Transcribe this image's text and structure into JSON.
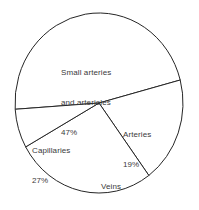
{
  "chart_data": {
    "type": "pie",
    "title": "",
    "subtitle": "",
    "xlabel": "",
    "ylabel": "",
    "legend_position": "none",
    "grid": false,
    "units": "percent",
    "total": 100,
    "categories": [
      "Small arteries and arterioles",
      "Arteries",
      "Capillaries",
      "Veins"
    ],
    "values": [
      47,
      19,
      27,
      7
    ],
    "slices": [
      {
        "label_line1": "Small arteries",
        "label_line2": "and arterioles",
        "value_text": "47%",
        "value": 47,
        "color": "#ffffff",
        "stroke": "#262626"
      },
      {
        "label_line1": "Arteries",
        "label_line2": "",
        "value_text": "19%",
        "value": 19,
        "color": "#ffffff",
        "stroke": "#262626"
      },
      {
        "label_line1": "Capillaries",
        "label_line2": "",
        "value_text": "27%",
        "value": 27,
        "color": "#ffffff",
        "stroke": "#262626"
      },
      {
        "label_line1": "Veins",
        "label_line2": "",
        "value_text": "7%",
        "value": 7,
        "color": "#ffffff",
        "stroke": "#262626"
      }
    ],
    "geometry": {
      "center_x": 99,
      "center_y": 103,
      "radius_x": 84,
      "radius_y": 90,
      "start_angle_deg": -4
    },
    "colors": {
      "background": "#ffffff",
      "outline": "#262626",
      "text": "#3a3a3a"
    }
  }
}
